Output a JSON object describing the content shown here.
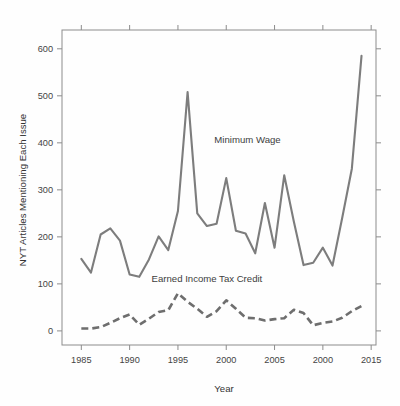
{
  "chart_data": {
    "type": "line",
    "title": "",
    "xlabel": "Year",
    "ylabel": "NYT Articles Mentioning Each Issue",
    "xlim": [
      1983,
      2015.5
    ],
    "ylim": [
      -30,
      640
    ],
    "xticks": [
      1985,
      1990,
      1995,
      2000,
      2005,
      2010,
      2015
    ],
    "xtick_labels": [
      "1985",
      "1990",
      "1995",
      "2000",
      "2005",
      "2000",
      "2015"
    ],
    "yticks": [
      0,
      100,
      200,
      300,
      400,
      500,
      600
    ],
    "ytick_labels": [
      "0",
      "100",
      "200",
      "300",
      "400",
      "500",
      "600"
    ],
    "grid": false,
    "legend_position": "inline-annotation",
    "x": [
      1985,
      1986,
      1987,
      1988,
      1989,
      1990,
      1991,
      1992,
      1993,
      1994,
      1995,
      1996,
      1997,
      1998,
      1999,
      2000,
      2001,
      2002,
      2003,
      2004,
      2005,
      2006,
      2007,
      2008,
      2009,
      2010,
      2011,
      2012,
      2013,
      2014
    ],
    "series": [
      {
        "name": "Minimum Wage",
        "style": "solid",
        "color": "#7d7d7d",
        "values": [
          153,
          124,
          205,
          218,
          192,
          120,
          115,
          152,
          201,
          172,
          255,
          508,
          250,
          223,
          228,
          325,
          213,
          207,
          165,
          272,
          177,
          331,
          232,
          140,
          145,
          177,
          139,
          240,
          345,
          585
        ],
        "annotation": "Minimum Wage",
        "annotation_x": 2002.2,
        "annotation_y": 400
      },
      {
        "name": "Earned Income Tax Credit",
        "style": "dashed",
        "color": "#6e6e6e",
        "values": [
          5,
          5,
          8,
          17,
          27,
          35,
          13,
          26,
          40,
          44,
          80,
          62,
          47,
          30,
          42,
          65,
          47,
          28,
          27,
          22,
          25,
          27,
          45,
          38,
          12,
          17,
          20,
          28,
          42,
          53
        ],
        "annotation": "Earned Income Tax Credit",
        "annotation_x": 1998.0,
        "annotation_y": 105
      }
    ]
  }
}
